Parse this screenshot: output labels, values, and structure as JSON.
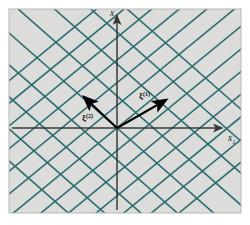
{
  "figure": {
    "panel": {
      "background_color": "#dcdcda",
      "border_color": "#b8b8b6",
      "x": 9,
      "y": 9,
      "width": 232,
      "height": 204
    },
    "page_background_color": "#ffffff"
  },
  "axes": {
    "origin": {
      "x": 117,
      "y": 128
    },
    "color": "#3a3a3a",
    "x_axis": {
      "label": "x",
      "subscript": "1",
      "label_x": 228,
      "label_y": 141,
      "start_x": 12,
      "end_x": 222,
      "y": 128
    },
    "y_axis": {
      "label": "x",
      "subscript": "2",
      "label_x": 110,
      "label_y": 16,
      "x": 117,
      "start_y": 210,
      "end_y": 16
    }
  },
  "lattice": {
    "line_color": "#2d6e73",
    "line_width": 1.6,
    "families": [
      {
        "name": "family-descending",
        "slope_dx": 1,
        "slope_dy": -0.82,
        "spacing": 17.5,
        "count": 13
      },
      {
        "name": "family-ascending",
        "slope_dx": 1,
        "slope_dy": 0.88,
        "spacing": 24,
        "count": 9
      }
    ]
  },
  "vectors": [
    {
      "name": "xi-1",
      "label": "ξ",
      "superscript": "(1)",
      "from": {
        "x": 117,
        "y": 128
      },
      "to": {
        "x": 166,
        "y": 100
      },
      "color": "#000000",
      "label_x": 139,
      "label_y": 99
    },
    {
      "name": "xi-2",
      "label": "ξ",
      "superscript": "(2)",
      "from": {
        "x": 117,
        "y": 128
      },
      "to": {
        "x": 84,
        "y": 97
      },
      "color": "#000000",
      "label_x": 82,
      "label_y": 121
    }
  ]
}
